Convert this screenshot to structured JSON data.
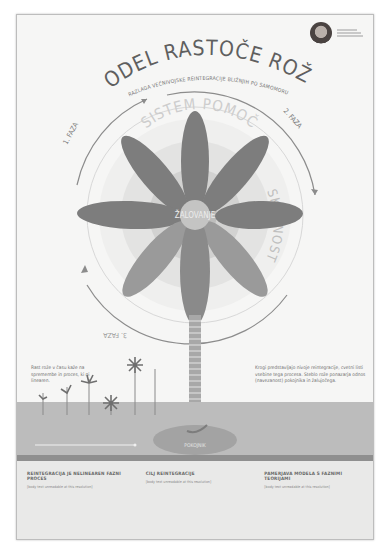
{
  "poster": {
    "title": "MODEL RASTOČE ROŽE",
    "subtitle": "RAZLAGA VEČNIVOJSKE REINTEGRACIJE BLIŽNJIH PO SAMOMORU",
    "author": {
      "name_lines": [
        "[unreadable]",
        "[unreadable]",
        "[unreadable]"
      ]
    }
  },
  "diagram": {
    "ring_label_top": "SISTEM POMOČ",
    "ring_label_right": "SKUPNOST",
    "ring_label_left": "DRUŽINA",
    "center_label": "ŽALOVANJE",
    "phases": [
      "1. FAZA",
      "2. FAZA",
      "3. FAZA"
    ],
    "petals": [
      {
        "id": "upper-left",
        "label": "[unreadable]"
      },
      {
        "id": "top",
        "label": "[unreadable]"
      },
      {
        "id": "upper-right",
        "label": "[unreadable]"
      },
      {
        "id": "left",
        "label": "[unreadable]"
      },
      {
        "id": "right",
        "label": "[unreadable]"
      },
      {
        "id": "lower-left",
        "label": "[unreadable]"
      },
      {
        "id": "bottom",
        "label": "[unreadable]"
      },
      {
        "id": "lower-right",
        "label": "[unreadable]"
      }
    ],
    "stem_label": "[unreadable]",
    "root_label": "POKOJNIK",
    "colors": {
      "petal": "#7d7d7d",
      "petal_light": "#9a9a9a",
      "ring_outer": "#e2e2e2",
      "ring_mid": "#cfcfcf",
      "ring_inner": "#b8b8b8",
      "arc": "#8c8c8c"
    }
  },
  "side_notes": {
    "left": "Rast rože v času kaže na spremembe in proces, ki ni linearen.",
    "right": "Krogi predstavljajo nivoje reintegracije, cvetni listi vsebine tega procesa. Steblo rože ponazarja odnos (navezanost) pokojnika in žalujočega."
  },
  "columns": [
    {
      "heading": "REINTEGRACIJA JE NELINEAREN FAZNI PROCES",
      "body": "[body text unreadable at this resolution]"
    },
    {
      "heading": "CILJ REINTEGRACIJE",
      "body": "[body text unreadable at this resolution]"
    },
    {
      "heading": "PAMERJAVA MODELA S FAZNIMI TEORIJAMI",
      "body": "[body text unreadable at this resolution]"
    }
  ]
}
